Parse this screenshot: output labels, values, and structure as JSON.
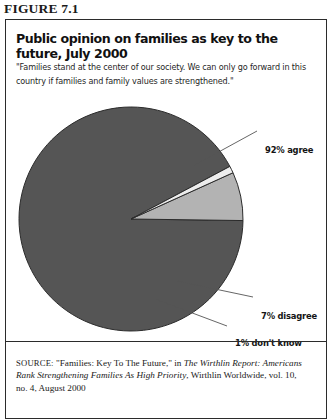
{
  "figure": {
    "label": "FIGURE 7.1"
  },
  "chart": {
    "title": "Public opinion on families as key to the future, July 2000",
    "quote": "\"Families stand at the center of our society. We can only go forward in this country if families and family values are strengthened.\"",
    "colors": {
      "agree": "#555555",
      "disagree": "#b3b3b3",
      "dontknow": "#ededed",
      "outline": "#2b2b2b",
      "leader_line": "#555555"
    }
  },
  "chart_data": {
    "type": "pie",
    "title": "Public opinion on families as key to the future, July 2000",
    "categories": [
      "92% agree",
      "7% disagree",
      "1% don't know"
    ],
    "values": [
      92,
      7,
      1
    ],
    "labels": {
      "agree": "92% agree",
      "disagree": "7% disagree",
      "dontknow": "1% don't know"
    },
    "unit": "percent",
    "legend": "none",
    "data_labels": true,
    "grid": false,
    "start_angle_deg": 28,
    "direction": "counterclockwise"
  },
  "source": {
    "kicker": "SOURCE:",
    "line1_plain": " \"Families: Key To The Future,\" in ",
    "line1_italic": "The Wirthlin Report:",
    "line2_italic": "Americans Rank Strengthening Families As High Priority",
    "line2_plain": ", Wirthlin",
    "line3_plain": "Worldwide, vol. 10, no. 4, August 2000"
  }
}
